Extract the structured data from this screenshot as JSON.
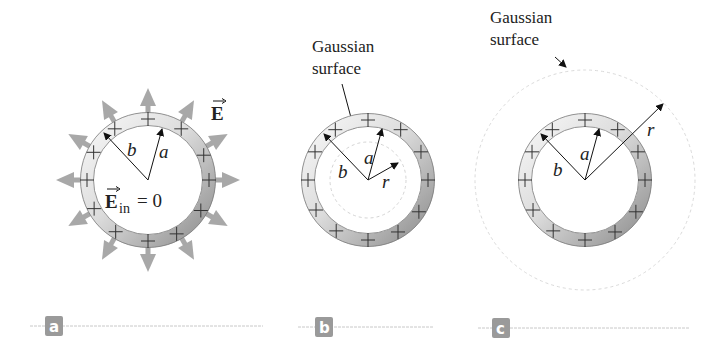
{
  "figure": {
    "panels": [
      {
        "id": "a",
        "tag": "a",
        "labels": {
          "outer_radius": "b",
          "inner_radius": "a",
          "field_outside": "E",
          "field_inside_symbol": "E",
          "field_inside_subscript": "in",
          "field_inside_value": "= 0"
        }
      },
      {
        "id": "b",
        "tag": "b",
        "labels": {
          "gaussian_line1": "Gaussian",
          "gaussian_line2": "surface",
          "outer_radius": "b",
          "inner_radius": "a",
          "gaussian_radius": "r"
        }
      },
      {
        "id": "c",
        "tag": "c",
        "labels": {
          "gaussian_line1": "Gaussian",
          "gaussian_line2": "surface",
          "outer_radius": "b",
          "inner_radius": "a",
          "gaussian_radius": "r"
        }
      }
    ],
    "charge_symbol": "+",
    "colors": {
      "field_arrow": "#a8a8a8",
      "shell_light": "#f0f0f0",
      "shell_dark": "#9c9c9c",
      "tag_bg": "#9a9a9a",
      "rule_line": "#c8c8c8",
      "gaussian_dash": "#d4d4d4"
    }
  }
}
